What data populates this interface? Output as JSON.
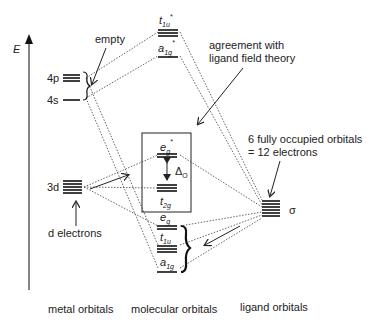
{
  "axis": {
    "label": "E"
  },
  "columns": {
    "metal": "metal orbitals",
    "molecular": "molecular orbitals",
    "ligand": "ligand orbitals"
  },
  "metal_orbitals": {
    "p": "4p",
    "s": "4s",
    "d": "3d"
  },
  "molecular_orbitals": {
    "t1u_star": {
      "main": "t",
      "sub": "1u",
      "star": "*"
    },
    "a1g_star": {
      "main": "a",
      "sub": "1g",
      "star": "*"
    },
    "eg_star": {
      "main": "e",
      "sub": "g",
      "star": "*"
    },
    "t2g": {
      "main": "t",
      "sub": "2g"
    },
    "eg": {
      "main": "e",
      "sub": "g"
    },
    "t1u": {
      "main": "t",
      "sub": "1u"
    },
    "a1g": {
      "main": "a",
      "sub": "1g"
    },
    "delta": {
      "main": "Δ",
      "sub": "O"
    }
  },
  "ligand_orbitals": {
    "sigma": "σ"
  },
  "annotations": {
    "empty": "empty",
    "agreement_line1": "agreement with",
    "agreement_line2": "ligand field theory",
    "occupied_line1": "6 fully occupied orbitals",
    "occupied_line2": "= 12 electrons",
    "d_electrons": "d electrons"
  }
}
